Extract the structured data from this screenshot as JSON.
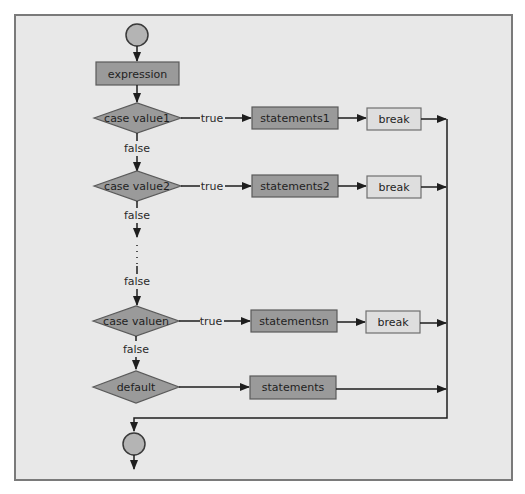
{
  "diagram": {
    "colors": {
      "frame_fill": "#e8e8e8",
      "frame_border": "#7a7a7a",
      "dark_node": "#9a9a9a",
      "light_node": "#dedede",
      "circle_node": "#b4b4b4",
      "edge": "#1e1e1e"
    },
    "start_node": {
      "shape": "circle"
    },
    "expression": {
      "label": "expression"
    },
    "cases": [
      {
        "condition": "case value1",
        "true_label": "true",
        "false_label": "false",
        "statement": "statements1",
        "break_label": "break"
      },
      {
        "condition": "case value2",
        "true_label": "true",
        "false_label": "false",
        "statement": "statements2",
        "break_label": "break"
      },
      {
        "condition": "case valuen",
        "true_label": "true",
        "false_label": "false",
        "statement": "statementsn",
        "break_label": "break"
      }
    ],
    "ellipsis_false_label": "false",
    "default_case": {
      "condition": "default",
      "statement": "statements"
    },
    "end_node": {
      "shape": "circle"
    }
  }
}
